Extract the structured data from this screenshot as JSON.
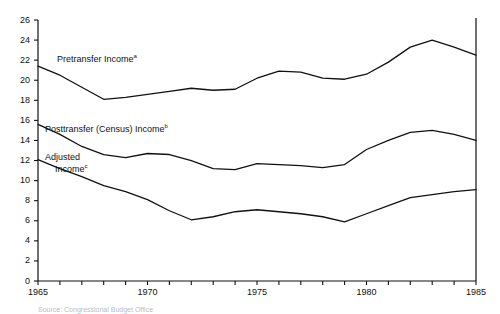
{
  "chart_data": {
    "type": "line",
    "title": "",
    "xlabel": "",
    "ylabel": "",
    "xlim": [
      1965,
      1985
    ],
    "ylim": [
      0,
      26
    ],
    "grid": false,
    "legend_position": "inline-annotations",
    "x": [
      1965,
      1966,
      1967,
      1968,
      1969,
      1970,
      1971,
      1972,
      1973,
      1974,
      1975,
      1976,
      1977,
      1978,
      1979,
      1980,
      1981,
      1982,
      1983,
      1984,
      1985
    ],
    "yticks": [
      0,
      2,
      4,
      6,
      8,
      10,
      12,
      14,
      16,
      18,
      20,
      22,
      24,
      26
    ],
    "ytick_labels": [
      "0",
      "2",
      "4",
      "6",
      "8",
      "10",
      "12",
      "14",
      "16",
      "18",
      "20",
      "22",
      "24",
      "26"
    ],
    "xticks": [
      1965,
      1966,
      1967,
      1968,
      1969,
      1970,
      1971,
      1972,
      1973,
      1974,
      1975,
      1976,
      1977,
      1978,
      1979,
      1980,
      1981,
      1982,
      1983,
      1984,
      1985
    ],
    "xtick_labels": [
      {
        "value": 1965,
        "label": "1965"
      },
      {
        "value": 1970,
        "label": "1970"
      },
      {
        "value": 1975,
        "label": "1975"
      },
      {
        "value": 1980,
        "label": "1980"
      },
      {
        "value": 1985,
        "label": "1985"
      }
    ],
    "series": [
      {
        "name": "Pretransfer Income",
        "footnote_marker": "a",
        "label_text": "Pretransfer Income",
        "color": "#111111",
        "values": [
          21.4,
          20.5,
          19.3,
          18.1,
          18.3,
          18.6,
          18.9,
          19.2,
          19.0,
          19.1,
          20.2,
          20.9,
          20.8,
          20.2,
          20.1,
          20.6,
          21.8,
          23.3,
          24.0,
          23.3,
          22.5
        ]
      },
      {
        "name": "Posttransfer (Census) Income",
        "footnote_marker": "b",
        "label_text": "Posttransfer (Census) Income",
        "color": "#111111",
        "values": [
          15.6,
          14.6,
          13.4,
          12.6,
          12.3,
          12.7,
          12.6,
          12.0,
          11.2,
          11.1,
          11.7,
          11.6,
          11.5,
          11.3,
          11.6,
          13.1,
          14.0,
          14.8,
          15.0,
          14.6,
          14.0
        ]
      },
      {
        "name": "Adjusted Income",
        "footnote_marker": "c",
        "label_text": "Adjusted Income",
        "color": "#111111",
        "values": [
          12.1,
          11.2,
          10.4,
          9.5,
          8.9,
          8.1,
          7.0,
          6.1,
          6.4,
          6.9,
          7.1,
          6.9,
          6.7,
          6.4,
          5.9,
          6.7,
          7.5,
          8.3,
          8.6,
          8.9,
          9.1
        ]
      }
    ],
    "annotations": [
      {
        "id": "pretransfer-label",
        "text": "Pretransfer Income",
        "marker": "a",
        "x_px": 57,
        "y_px": 53
      },
      {
        "id": "posttransfer-label",
        "text": "Posttransfer (Census) Income",
        "marker": "b",
        "x_px": 45,
        "y_px": 123
      },
      {
        "id": "adjusted-label-line1",
        "text": "Adjusted",
        "marker": "",
        "x_px": 45,
        "y_px": 152
      },
      {
        "id": "adjusted-label-line2",
        "text": "Income",
        "marker": "c",
        "x_px": 55,
        "y_px": 163
      }
    ],
    "source_note": "Source: Congressional Budget Office"
  }
}
